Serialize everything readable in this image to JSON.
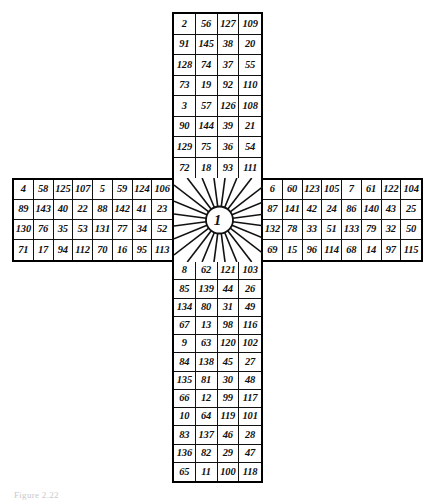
{
  "figure": {
    "caption": "Figure 2.22",
    "center_label": "1",
    "ink_color": "#111111",
    "background_color": "#ffffff"
  },
  "chart_data": {
    "type": "table",
    "xlabel": "",
    "ylabel": "",
    "grid": true,
    "legend": "none",
    "center_cell": "1",
    "arms": {
      "top": {
        "columns": 4,
        "rows": 8,
        "values": [
          [
            "2",
            "56",
            "127",
            "109"
          ],
          [
            "91",
            "145",
            "38",
            "20"
          ],
          [
            "128",
            "74",
            "37",
            "55"
          ],
          [
            "73",
            "19",
            "92",
            "110"
          ],
          [
            "3",
            "57",
            "126",
            "108"
          ],
          [
            "90",
            "144",
            "39",
            "21"
          ],
          [
            "129",
            "75",
            "36",
            "54"
          ],
          [
            "72",
            "18",
            "93",
            "111"
          ]
        ]
      },
      "left": {
        "columns": 8,
        "rows": 4,
        "values": [
          [
            "4",
            "58",
            "125",
            "107",
            "5",
            "59",
            "124",
            "106"
          ],
          [
            "89",
            "143",
            "40",
            "22",
            "88",
            "142",
            "41",
            "23"
          ],
          [
            "130",
            "76",
            "35",
            "53",
            "131",
            "77",
            "34",
            "52"
          ],
          [
            "71",
            "17",
            "94",
            "112",
            "70",
            "16",
            "95",
            "113"
          ]
        ]
      },
      "right": {
        "columns": 8,
        "rows": 4,
        "values": [
          [
            "6",
            "60",
            "123",
            "105",
            "7",
            "61",
            "122",
            "104"
          ],
          [
            "87",
            "141",
            "42",
            "24",
            "86",
            "140",
            "43",
            "25"
          ],
          [
            "132",
            "78",
            "33",
            "51",
            "133",
            "79",
            "32",
            "50"
          ],
          [
            "69",
            "15",
            "96",
            "114",
            "68",
            "14",
            "97",
            "115"
          ]
        ]
      },
      "bottom": {
        "columns": 4,
        "rows": 12,
        "values": [
          [
            "8",
            "62",
            "121",
            "103"
          ],
          [
            "85",
            "139",
            "44",
            "26"
          ],
          [
            "134",
            "80",
            "31",
            "49"
          ],
          [
            "67",
            "13",
            "98",
            "116"
          ],
          [
            "9",
            "63",
            "120",
            "102"
          ],
          [
            "84",
            "138",
            "45",
            "27"
          ],
          [
            "135",
            "81",
            "30",
            "48"
          ],
          [
            "66",
            "12",
            "99",
            "117"
          ],
          [
            "10",
            "64",
            "119",
            "101"
          ],
          [
            "83",
            "137",
            "46",
            "28"
          ],
          [
            "136",
            "82",
            "29",
            "47"
          ],
          [
            "65",
            "11",
            "100",
            "118"
          ]
        ]
      }
    }
  }
}
